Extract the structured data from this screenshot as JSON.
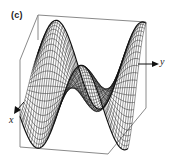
{
  "figure": {
    "panel_label": "(c)",
    "axes": {
      "x_label": "x",
      "y_label": "y"
    },
    "colors": {
      "frame": "#8a8a8a",
      "mesh": "#111111",
      "background": "#ffffff"
    },
    "surface": {
      "type": "wireframe",
      "description": "3D wireframe surface of a standing-wave-like function inside a perspective box",
      "features": [
        "large peak (left-back)",
        "deep valley (front-center)",
        "second peak (center-right)",
        "shallow trough (right)"
      ]
    }
  }
}
